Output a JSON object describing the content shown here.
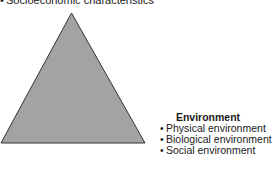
{
  "top_label": {
    "bullet": "•",
    "text": "Socioeconomic characteristics"
  },
  "triangle": {
    "fill": "#a3a3a3",
    "stroke": "#333333"
  },
  "environment": {
    "title": "Environment",
    "items": [
      {
        "bullet": "•",
        "text": "Physical environment"
      },
      {
        "bullet": "•",
        "text": "Biological environment"
      },
      {
        "bullet": "•",
        "text": "Social environment"
      }
    ]
  }
}
